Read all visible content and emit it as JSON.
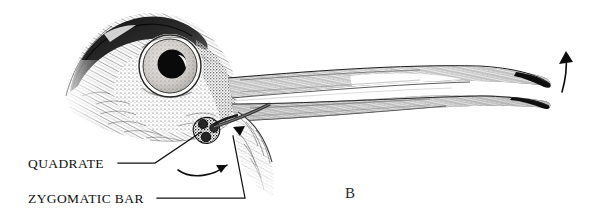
{
  "figure": {
    "panel_letter": "B",
    "background_color": "#ffffff",
    "ink_color": "#101010"
  },
  "annotations": [
    {
      "id": "quadrate",
      "label": "QUADRATE",
      "text_x": 28,
      "text_y": 168,
      "leader_path": "M 118 163 L 155 163 L 201 132",
      "target": "quadrate-bone"
    },
    {
      "id": "zygomatic-bar",
      "label": "ZYGOMATIC BAR",
      "text_x": 28,
      "text_y": 203,
      "leader_path": "M 157 198 L 245 198 L 233 136",
      "target": "zygomatic-bar-strut"
    }
  ],
  "motion_indicators": [
    {
      "id": "quadrate-rotation-arrow",
      "description": "curved arrow showing quadrate swinging forward",
      "path": "M 178 170 C 192 180 214 176 227 165",
      "head_points": "227,165 216,165 221,173"
    },
    {
      "id": "zygomatic-thrust-arrow",
      "description": "short arrowhead showing zygomatic bar pushing forward",
      "path": "M 228 140 L 243 128",
      "head_points": "245,126 233,127 240,136"
    },
    {
      "id": "bill-elevation-arrow",
      "description": "curved arrow at bill tip showing upper mandible raising",
      "path": "M 562 92 C 566 78 567 66 566 56",
      "head_points": "566,51 559,64 573,62"
    }
  ],
  "anatomy_parts": [
    {
      "id": "crown",
      "name": "dark crown patch"
    },
    {
      "id": "eye",
      "name": "eye with pale iris and dark pupil"
    },
    {
      "id": "cheek",
      "name": "feathered cheek and auriculars"
    },
    {
      "id": "upper-mandible",
      "name": "upper mandible / maxilla"
    },
    {
      "id": "lower-mandible",
      "name": "lower mandible"
    },
    {
      "id": "quadrate-bone",
      "name": "quadrate bone"
    },
    {
      "id": "zygomatic-bar-strut",
      "name": "zygomatic bar"
    },
    {
      "id": "throat",
      "name": "throat feathering"
    }
  ]
}
